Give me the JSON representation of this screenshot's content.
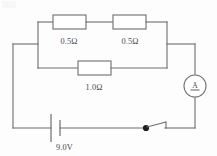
{
  "diagram": {
    "type": "electrical-circuit",
    "ink_color": "#6e6e70",
    "background_color": "#fdfdfd",
    "components": {
      "resistor_top_left": {
        "label": "0.5Ω",
        "value": 0.5,
        "unit": "ohm",
        "name": "resistor-top-left"
      },
      "resistor_top_right": {
        "label": "0.5Ω",
        "value": 0.5,
        "unit": "ohm",
        "name": "resistor-top-right"
      },
      "resistor_bottom": {
        "label": "1.0Ω",
        "value": 1.0,
        "unit": "ohm",
        "name": "resistor-bottom"
      },
      "battery": {
        "label": "9.0V",
        "value": 9.0,
        "unit": "volt",
        "name": "battery"
      },
      "ammeter": {
        "label": "A",
        "name": "ammeter"
      },
      "switch": {
        "state": "closed",
        "name": "switch"
      }
    }
  }
}
